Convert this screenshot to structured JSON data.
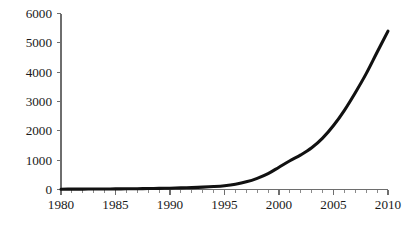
{
  "chart_data": {
    "type": "line",
    "title": "",
    "subtitle": "",
    "xlabel": "",
    "ylabel": "",
    "xlim": [
      1980,
      2010
    ],
    "ylim": [
      0,
      6000
    ],
    "grid": false,
    "legend": null,
    "legend_position": "none",
    "x_ticks_major": [
      "1980",
      "1985",
      "1990",
      "1995",
      "2000",
      "2005",
      "2010"
    ],
    "x_ticks_major_values": [
      1980,
      1985,
      1990,
      1995,
      2000,
      2005,
      2010
    ],
    "x_minor_tick_step": 1,
    "y_ticks": [
      "0",
      "1000",
      "2000",
      "3000",
      "4000",
      "5000",
      "6000"
    ],
    "y_ticks_values": [
      0,
      1000,
      2000,
      3000,
      4000,
      5000,
      6000
    ],
    "series": [
      {
        "name": "series-1",
        "color": "#111111",
        "x": [
          1980,
          1981,
          1982,
          1983,
          1984,
          1985,
          1986,
          1987,
          1988,
          1989,
          1990,
          1991,
          1992,
          1993,
          1994,
          1995,
          1996,
          1997,
          1998,
          1999,
          2000,
          2001,
          2002,
          2003,
          2004,
          2005,
          2006,
          2007,
          2008,
          2009,
          2010
        ],
        "values": [
          10,
          12,
          14,
          16,
          18,
          20,
          24,
          28,
          32,
          38,
          45,
          55,
          65,
          80,
          100,
          130,
          180,
          260,
          380,
          540,
          760,
          980,
          1180,
          1420,
          1750,
          2180,
          2700,
          3300,
          3950,
          4680,
          5400
        ]
      }
    ]
  },
  "axes": {
    "x_axis_color": "#6e6e6e",
    "y_axis_color": "#6e6e6e"
  }
}
